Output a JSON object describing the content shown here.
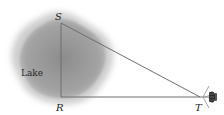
{
  "diagram": {
    "lake_label": "Lake",
    "points": {
      "S": {
        "label": "S"
      },
      "R": {
        "label": "R"
      },
      "T": {
        "label": "T"
      }
    },
    "segments": [
      "SR",
      "RT",
      "ST"
    ],
    "instrument": "surveyor-transit",
    "colors": {
      "lake_fill": "#9a9a9a",
      "lake_halo": "#cfcfcf",
      "line": "#6e6e6e"
    }
  }
}
